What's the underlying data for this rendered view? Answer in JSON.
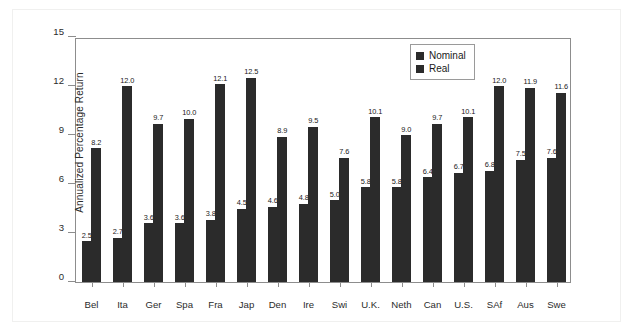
{
  "figure": {
    "background_color": "#ffffff",
    "bar_color": "#2b2b2b",
    "axis_color": "#8d8d8d"
  },
  "chart_data": {
    "type": "bar",
    "title": "",
    "xlabel": "",
    "ylabel": "Annualized Percentage Return",
    "ylim": [
      0,
      15
    ],
    "yticks": [
      "0",
      "3",
      "6",
      "9",
      "12",
      "15"
    ],
    "grid": false,
    "legend_position": "top-right",
    "categories": [
      "Bel",
      "Ita",
      "Ger",
      "Spa",
      "Fra",
      "Jap",
      "Den",
      "Ire",
      "Swi",
      "U.K.",
      "Neth",
      "Can",
      "U.S.",
      "SAf",
      "Aus",
      "Swe"
    ],
    "series": [
      {
        "name": "Real",
        "values": [
          2.5,
          2.7,
          3.6,
          3.6,
          3.8,
          4.5,
          4.6,
          4.8,
          5.0,
          5.8,
          5.8,
          6.4,
          6.7,
          6.8,
          7.5,
          7.6
        ],
        "labels": [
          "2.5",
          "2.7",
          "3.6",
          "3.6",
          "3.8",
          "4.5",
          "4.6",
          "4.8",
          "5.0",
          "5.8",
          "5.8",
          "6.4",
          "6.7",
          "6.8",
          "7.5",
          "7.6"
        ]
      },
      {
        "name": "Nominal",
        "values": [
          8.2,
          12.0,
          9.7,
          10.0,
          12.1,
          12.5,
          8.9,
          9.5,
          7.6,
          10.1,
          9.0,
          9.7,
          10.1,
          12.0,
          11.9,
          11.6
        ],
        "labels": [
          "8.2",
          "12.0",
          "9.7",
          "10.0",
          "12.1",
          "12.5",
          "8.9",
          "9.5",
          "7.6",
          "10.1",
          "9.0",
          "9.7",
          "10.1",
          "12.0",
          "11.9",
          "11.6"
        ]
      }
    ],
    "legend": [
      {
        "label": "Nominal",
        "color": "#2b2b2b"
      },
      {
        "label": "Real",
        "color": "#2b2b2b"
      }
    ]
  }
}
